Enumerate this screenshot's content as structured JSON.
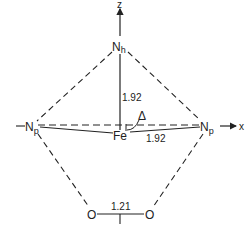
{
  "diagram": {
    "colors": {
      "line": "#222222",
      "background": "#ffffff"
    },
    "axes": {
      "z_label": "z",
      "x_label": "x"
    },
    "atoms": {
      "n_h": {
        "symbol": "N",
        "subscript": "h"
      },
      "n_p_left": {
        "symbol": "N",
        "subscript": "p",
        "prefix": "—"
      },
      "n_p_right": {
        "symbol": "N",
        "subscript": "p"
      },
      "fe": {
        "symbol": "Fe"
      },
      "o_left": {
        "symbol": "O"
      },
      "o_right": {
        "symbol": "O"
      }
    },
    "labels": {
      "fe_nh_distance": "1.92",
      "fe_np_distance": "1.92",
      "o_o_distance": "1.21",
      "displacement": "Δ"
    }
  }
}
